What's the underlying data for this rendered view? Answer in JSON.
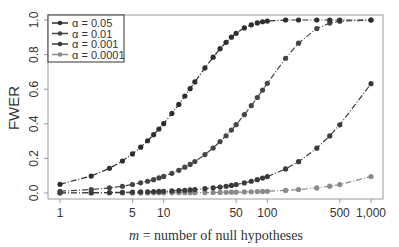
{
  "chart_data": {
    "type": "line",
    "title": "",
    "xlabel": "m = number of null hypotheses",
    "xlabel_var": "m",
    "xlabel_rest": " = number of null hypotheses",
    "ylabel": "FWER",
    "xscale": "log",
    "xlim": [
      1,
      1000
    ],
    "ylim": [
      0,
      1
    ],
    "x_ticks": [
      1,
      5,
      10,
      50,
      100,
      500,
      1000
    ],
    "x_tick_labels": [
      "1",
      "5",
      "10",
      "50",
      "100",
      "500",
      "1,000"
    ],
    "y_ticks": [
      0.0,
      0.2,
      0.4,
      0.6,
      0.8,
      1.0
    ],
    "y_tick_labels": [
      "0.0",
      "0.2",
      "0.4",
      "0.6",
      "0.8",
      "1.0"
    ],
    "grid": false,
    "legend_position": "top-left",
    "x": [
      1,
      2,
      3,
      4,
      5,
      6,
      7,
      8,
      9,
      10,
      12,
      14,
      16,
      18,
      20,
      25,
      30,
      35,
      40,
      45,
      50,
      60,
      70,
      80,
      90,
      100,
      150,
      200,
      300,
      400,
      500,
      1000
    ],
    "series": [
      {
        "name": "α = 0.05",
        "alpha": 0.05,
        "color": "#2e2e2e",
        "dash": "6,2,1,2",
        "values": [
          0.05,
          0.098,
          0.143,
          0.185,
          0.226,
          0.265,
          0.302,
          0.337,
          0.37,
          0.401,
          0.46,
          0.512,
          0.56,
          0.603,
          0.642,
          0.723,
          0.785,
          0.834,
          0.871,
          0.901,
          0.923,
          0.954,
          0.972,
          0.983,
          0.99,
          0.994,
          1.0,
          1.0,
          1.0,
          1.0,
          1.0,
          1.0
        ]
      },
      {
        "name": "α = 0.01",
        "alpha": 0.01,
        "color": "#454545",
        "dash": "6,2,1,2",
        "values": [
          0.01,
          0.02,
          0.03,
          0.039,
          0.049,
          0.059,
          0.068,
          0.077,
          0.087,
          0.096,
          0.114,
          0.131,
          0.149,
          0.165,
          0.182,
          0.222,
          0.26,
          0.297,
          0.331,
          0.364,
          0.395,
          0.453,
          0.505,
          0.552,
          0.595,
          0.634,
          0.779,
          0.866,
          0.951,
          0.982,
          0.993,
          1.0
        ]
      },
      {
        "name": "α = 0.001",
        "alpha": 0.001,
        "color": "#3a3a3a",
        "dash": "6,2,1,2",
        "values": [
          0.001,
          0.002,
          0.003,
          0.004,
          0.005,
          0.006,
          0.007,
          0.008,
          0.009,
          0.01,
          0.012,
          0.014,
          0.016,
          0.018,
          0.02,
          0.025,
          0.03,
          0.034,
          0.039,
          0.044,
          0.049,
          0.058,
          0.068,
          0.077,
          0.086,
          0.095,
          0.139,
          0.181,
          0.259,
          0.33,
          0.394,
          0.632
        ]
      },
      {
        "name": "α = 0.0001",
        "alpha": 0.0001,
        "color": "#8a8a8a",
        "dash": "6,2,1,2",
        "values": [
          0.0001,
          0.0002,
          0.0003,
          0.0004,
          0.0005,
          0.0006,
          0.0007,
          0.0008,
          0.0009,
          0.001,
          0.0012,
          0.0014,
          0.0016,
          0.0018,
          0.002,
          0.0025,
          0.003,
          0.0035,
          0.004,
          0.0045,
          0.005,
          0.006,
          0.007,
          0.008,
          0.009,
          0.00995,
          0.0149,
          0.0198,
          0.0296,
          0.0392,
          0.0488,
          0.0952
        ]
      }
    ]
  },
  "colors": {
    "axis": "#999999",
    "text": "#333333",
    "legend_border": "#333333"
  }
}
